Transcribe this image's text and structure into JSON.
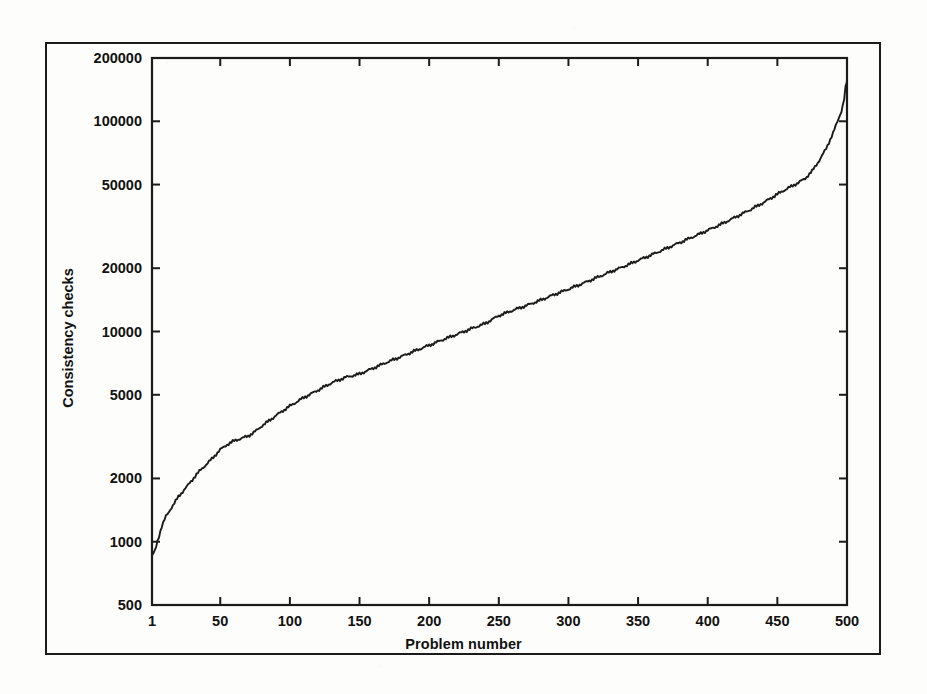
{
  "figure": {
    "background_color": "#fdfdfb",
    "line_color": "#1b1b1b",
    "frame_color": "#1b1b1b"
  },
  "chart_data": {
    "type": "line",
    "title": "",
    "subtitle": "",
    "xlabel": "Problem number",
    "ylabel": "Consistency checks",
    "xscale": "linear",
    "yscale": "log",
    "xlim": [
      1,
      500
    ],
    "ylim": [
      500,
      200000
    ],
    "grid": false,
    "legend": null,
    "legend_position": "none",
    "xticks": [
      1,
      50,
      100,
      150,
      200,
      250,
      300,
      350,
      400,
      450,
      500
    ],
    "xtick_labels": [
      "1",
      "50",
      "100",
      "150",
      "200",
      "250",
      "300",
      "350",
      "400",
      "450",
      "500"
    ],
    "yticks": [
      500,
      1000,
      2000,
      5000,
      10000,
      20000,
      50000,
      100000,
      200000
    ],
    "ytick_labels": [
      "500",
      "1000",
      "2000",
      "5000",
      "10000",
      "20000",
      "50000",
      "100000",
      "200000"
    ],
    "series": [
      {
        "name": "Consistency checks (sorted)",
        "x": [
          1,
          3,
          5,
          8,
          11,
          14,
          17,
          20,
          24,
          28,
          32,
          36,
          40,
          45,
          50,
          55,
          60,
          65,
          70,
          75,
          80,
          85,
          90,
          95,
          100,
          110,
          120,
          130,
          140,
          150,
          160,
          170,
          180,
          190,
          200,
          210,
          220,
          230,
          240,
          250,
          260,
          270,
          280,
          290,
          300,
          310,
          320,
          330,
          340,
          350,
          360,
          370,
          380,
          390,
          400,
          410,
          420,
          430,
          440,
          450,
          455,
          460,
          465,
          470,
          475,
          480,
          485,
          490,
          493,
          496,
          498,
          499,
          500
        ],
        "y": [
          855,
          900,
          1010,
          1180,
          1320,
          1420,
          1520,
          1640,
          1760,
          1900,
          2050,
          2200,
          2330,
          2520,
          2740,
          2900,
          3020,
          3100,
          3180,
          3340,
          3560,
          3760,
          3980,
          4200,
          4420,
          4850,
          5250,
          5700,
          6050,
          6280,
          6700,
          7150,
          7600,
          8100,
          8600,
          9150,
          9700,
          10300,
          10900,
          11900,
          12600,
          13300,
          14100,
          15000,
          15900,
          16900,
          18000,
          19200,
          20400,
          21800,
          23200,
          24800,
          26500,
          28300,
          30300,
          32500,
          35000,
          37800,
          41000,
          45000,
          47000,
          49000,
          51000,
          53500,
          58000,
          65000,
          74000,
          88000,
          99000,
          112000,
          128000,
          145000,
          155000
        ]
      }
    ]
  },
  "axes_geometry": {
    "plot_left_px": 152,
    "plot_top_px": 58,
    "plot_right_px": 847,
    "plot_bottom_px": 605,
    "tick_length_px": 8,
    "tick_direction": "in",
    "frame_all_sides": true
  },
  "outer_border": {
    "present": true,
    "label": "figure-border"
  }
}
